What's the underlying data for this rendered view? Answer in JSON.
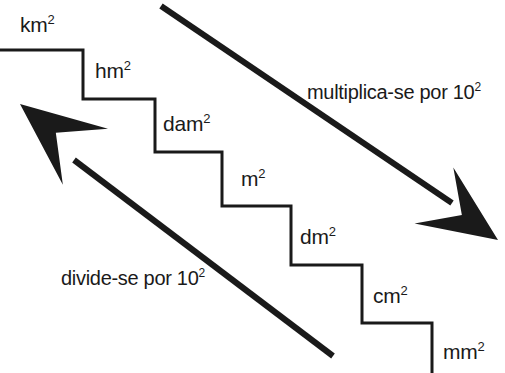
{
  "diagram": {
    "language": "pt-BR",
    "background_color": "#ffffff",
    "stroke_color": "#1a1a1a",
    "text_color": "#1a1a1a",
    "width": 505,
    "height": 373,
    "staircase": {
      "name": "area-unit-staircase",
      "stroke_width": 3,
      "steps": [
        {
          "id": "step-km2",
          "label": "km",
          "exponent": "2",
          "label_x": 20,
          "label_y": 14,
          "tread_from_x": 0,
          "tread_to_x": 83,
          "tread_y": 50,
          "riser_x": 83,
          "riser_from_y": 50,
          "riser_to_y": 99
        },
        {
          "id": "step-hm2",
          "label": "hm",
          "exponent": "2",
          "label_x": 95,
          "label_y": 60,
          "tread_from_x": 83,
          "tread_to_x": 155,
          "tread_y": 99,
          "riser_x": 155,
          "riser_from_y": 99,
          "riser_to_y": 152
        },
        {
          "id": "step-dam2",
          "label": "dam",
          "exponent": "2",
          "label_x": 163,
          "label_y": 113,
          "tread_from_x": 155,
          "tread_to_x": 222,
          "tread_y": 152,
          "riser_x": 222,
          "riser_from_y": 152,
          "riser_to_y": 206
        },
        {
          "id": "step-m2",
          "label": "m",
          "exponent": "2",
          "label_x": 241,
          "label_y": 168,
          "tread_from_x": 222,
          "tread_to_x": 291,
          "tread_y": 206,
          "riser_x": 291,
          "riser_from_y": 206,
          "riser_to_y": 265
        },
        {
          "id": "step-dm2",
          "label": "dm",
          "exponent": "2",
          "label_x": 300,
          "label_y": 226,
          "tread_from_x": 291,
          "tread_to_x": 362,
          "tread_y": 265,
          "riser_x": 362,
          "riser_from_y": 265,
          "riser_to_y": 323
        },
        {
          "id": "step-cm2",
          "label": "cm",
          "exponent": "2",
          "label_x": 373,
          "label_y": 285,
          "tread_from_x": 362,
          "tread_to_x": 432,
          "tread_y": 323,
          "riser_x": 432,
          "riser_from_y": 323,
          "riser_to_y": 373
        },
        {
          "id": "step-mm2",
          "label": "mm",
          "exponent": "2",
          "label_x": 443,
          "label_y": 341,
          "tread_from_x": null,
          "tread_to_x": null,
          "tread_y": null,
          "riser_x": null,
          "riser_from_y": null,
          "riser_to_y": null
        }
      ]
    },
    "arrows": [
      {
        "id": "arrow-multiply",
        "direction": "down-right",
        "caption": "multiplica-se por 10",
        "caption_exponent": "2",
        "caption_x": 307,
        "caption_y": 82,
        "shaft_x1": 161,
        "shaft_y1": 6,
        "shaft_x2": 452,
        "shaft_y2": 203,
        "head_tip_x": 498,
        "head_tip_y": 240,
        "stroke_width": 6
      },
      {
        "id": "arrow-divide",
        "direction": "up-left",
        "caption": "divide-se por 10",
        "caption_exponent": "2",
        "caption_x": 61,
        "caption_y": 268,
        "shaft_x1": 333,
        "shaft_y1": 356,
        "shaft_x2": 74,
        "shaft_y2": 160,
        "head_tip_x": 20,
        "head_tip_y": 104,
        "stroke_width": 6
      }
    ]
  }
}
